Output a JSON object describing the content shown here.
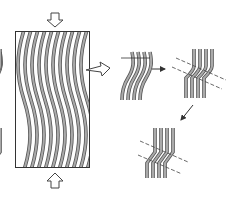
{
  "diagram": {
    "colors": {
      "fiber_fill": "#a8a8a8",
      "fiber_edge": "#555555",
      "outline": "#333333",
      "dashed": "#444444",
      "background": "#ffffff"
    },
    "panels": [
      {
        "id": "panel-1",
        "label": "Wavy fiber bundle under axial compression"
      },
      {
        "id": "panel-2",
        "label": "Magnified wavy fiber segment"
      },
      {
        "id": "panel-3",
        "label": "Kink band initiation with band boundaries"
      },
      {
        "id": "panel-4",
        "label": "Fully developed kink band"
      }
    ],
    "arrows": [
      {
        "id": "arrow-compression-top",
        "direction": "down"
      },
      {
        "id": "arrow-compression-bottom",
        "direction": "up"
      },
      {
        "id": "arrow-magnify",
        "direction": "right"
      },
      {
        "id": "arrow-step-1",
        "direction": "right"
      },
      {
        "id": "arrow-step-2",
        "direction": "down-left"
      }
    ]
  }
}
